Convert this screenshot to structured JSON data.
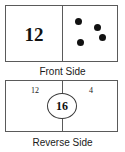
{
  "figure": {
    "title": "",
    "colors": {
      "border": "#5a5a5a",
      "ink": "#111111",
      "background": "#ffffff",
      "dot": "#111111"
    }
  },
  "front_card": {
    "caption": "Front Side",
    "left_half": {
      "number": "12"
    },
    "right_half": {
      "dot_count": "4",
      "dots": [
        {
          "label": "dot-1",
          "x": 12,
          "y": 12
        },
        {
          "label": "dot-2",
          "x": 31,
          "y": 18
        },
        {
          "label": "dot-3",
          "x": 36,
          "y": 28
        },
        {
          "label": "dot-4",
          "x": 14,
          "y": 33
        }
      ]
    }
  },
  "reverse_card": {
    "caption": "Reverse Side",
    "left_number": "12",
    "right_number": "4",
    "sum_circle": "16"
  }
}
